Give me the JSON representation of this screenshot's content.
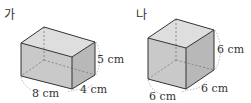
{
  "figures": [
    {
      "title": "가",
      "shape": "rectangular-prism",
      "dimensions": {
        "length": "8 cm",
        "width": "4 cm",
        "height": "5 cm"
      },
      "labels": {
        "length": "8 cm",
        "width": "4 cm",
        "height": "5 cm"
      }
    },
    {
      "title": "나",
      "shape": "cube",
      "dimensions": {
        "length": "6 cm",
        "width": "6 cm",
        "height": "6 cm"
      },
      "labels": {
        "length": "6 cm",
        "width": "6 cm",
        "height": "6 cm"
      }
    }
  ],
  "colors": {
    "face_front": "#c8c8c8",
    "face_side": "#b9b9b9",
    "face_top": "#dcdcdc",
    "edge": "#333333",
    "hidden_edge": "#777777"
  }
}
